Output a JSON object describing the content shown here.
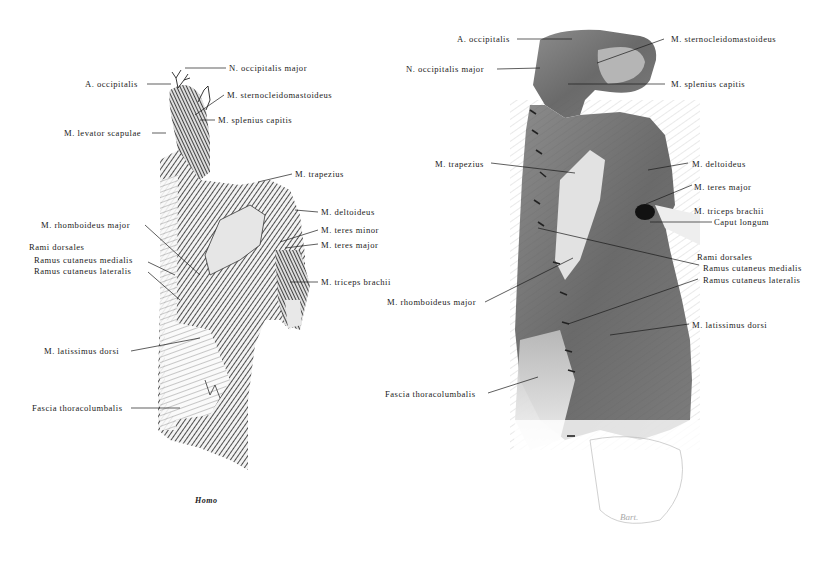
{
  "figure_left": {
    "caption": "Homo",
    "labels": {
      "n_occipitalis_major": "N. occipitalis major",
      "a_occipitalis": "A. occipitalis",
      "m_sternocleidomastoideus": "M. sternocleidomastoideus",
      "m_splenius_capitis": "M. splenius capitis",
      "m_levator_scapulae": "M. levator scapulae",
      "m_trapezius": "M. trapezius",
      "m_deltoideus": "M. deltoideus",
      "m_rhomboideus_major": "M. rhomboideus major",
      "m_teres_minor": "M. teres minor",
      "m_teres_major": "M. teres major",
      "rami_dorsales": "Rami dorsales",
      "ramus_cutaneus_medialis": "Ramus cutaneus medialis",
      "ramus_cutaneus_lateralis": "Ramus cutaneus lateralis",
      "m_triceps_brachii": "M. triceps brachii",
      "m_latissimus_dorsi": "M. latissimus dorsi",
      "fascia_thoracolumbalis": "Fascia thoracolumbalis"
    }
  },
  "figure_right": {
    "labels": {
      "a_occipitalis": "A. occipitalis",
      "m_sternocleidomastoideus": "M. sternocleidomastoideus",
      "n_occipitalis_major": "N. occipitalis major",
      "m_splenius_capitis": "M. splenius capitis",
      "m_trapezius": "M. trapezius",
      "m_deltoideus": "M. deltoideus",
      "m_teres_major": "M. teres major",
      "m_triceps_brachii": "M. triceps brachii",
      "caput_longum": "Caput longum",
      "rami_dorsales": "Rami dorsales",
      "ramus_cutaneus_medialis": "Ramus cutaneus medialis",
      "ramus_cutaneus_lateralis": "Ramus cutaneus lateralis",
      "m_rhomboideus_major": "M. rhomboideus major",
      "m_latissimus_dorsi": "M. latissimus dorsi",
      "fascia_thoracolumbalis": "Fascia thoracolumbalis"
    }
  }
}
